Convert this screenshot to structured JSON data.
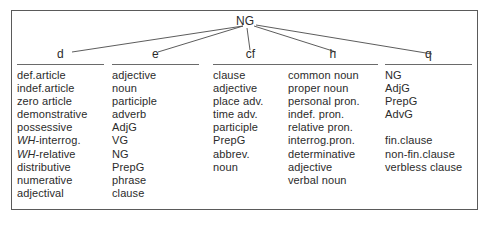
{
  "figure": {
    "root": {
      "label": "NG"
    },
    "columns": [
      {
        "id": "d",
        "head": "d",
        "items": [
          {
            "text": "def.article"
          },
          {
            "text": "indef.article"
          },
          {
            "text": "zero article"
          },
          {
            "text": "demonstrative"
          },
          {
            "text": "possessive"
          },
          {
            "text": "WH-interrog.",
            "italic_prefix": "WH",
            "rest": "-interrog."
          },
          {
            "text": "WH-relative",
            "italic_prefix": "WH",
            "rest": "-relative"
          },
          {
            "text": "distributive"
          },
          {
            "text": "numerative"
          },
          {
            "text": "adjectival"
          }
        ]
      },
      {
        "id": "e",
        "head": "e",
        "items": [
          {
            "text": "adjective"
          },
          {
            "text": "noun"
          },
          {
            "text": "participle"
          },
          {
            "text": "adverb"
          },
          {
            "text": "AdjG"
          },
          {
            "text": "VG"
          },
          {
            "text": "NG"
          },
          {
            "text": "PrepG"
          },
          {
            "text": "phrase"
          },
          {
            "text": "clause"
          }
        ]
      },
      {
        "id": "cf",
        "head": "cf",
        "items": [
          {
            "text": "clause"
          },
          {
            "text": "adjective"
          },
          {
            "text": "place adv."
          },
          {
            "text": "time adv."
          },
          {
            "text": "participle"
          },
          {
            "text": "PrepG"
          },
          {
            "text": "abbrev."
          },
          {
            "text": "noun"
          }
        ]
      },
      {
        "id": "h",
        "head": "h",
        "items": [
          {
            "text": "common noun"
          },
          {
            "text": "proper noun"
          },
          {
            "text": "personal pron."
          },
          {
            "text": "indef. pron."
          },
          {
            "text": "relative pron."
          },
          {
            "text": "interrog.pron."
          },
          {
            "text": "determinative"
          },
          {
            "text": "adjective"
          },
          {
            "text": "verbal noun"
          }
        ]
      },
      {
        "id": "q",
        "head": "q",
        "items": [
          {
            "text": "NG"
          },
          {
            "text": "AdjG"
          },
          {
            "text": "PrepG"
          },
          {
            "text": "AdvG"
          },
          {
            "text": "",
            "spacer": true
          },
          {
            "text": "fin.clause"
          },
          {
            "text": "non-fin.clause"
          },
          {
            "text": "verbless clause"
          }
        ]
      }
    ],
    "colors": {
      "ink": "#2b2b2b",
      "rule": "#6a6a6a",
      "frame": "#5a5a5a",
      "background": "#ffffff"
    }
  }
}
